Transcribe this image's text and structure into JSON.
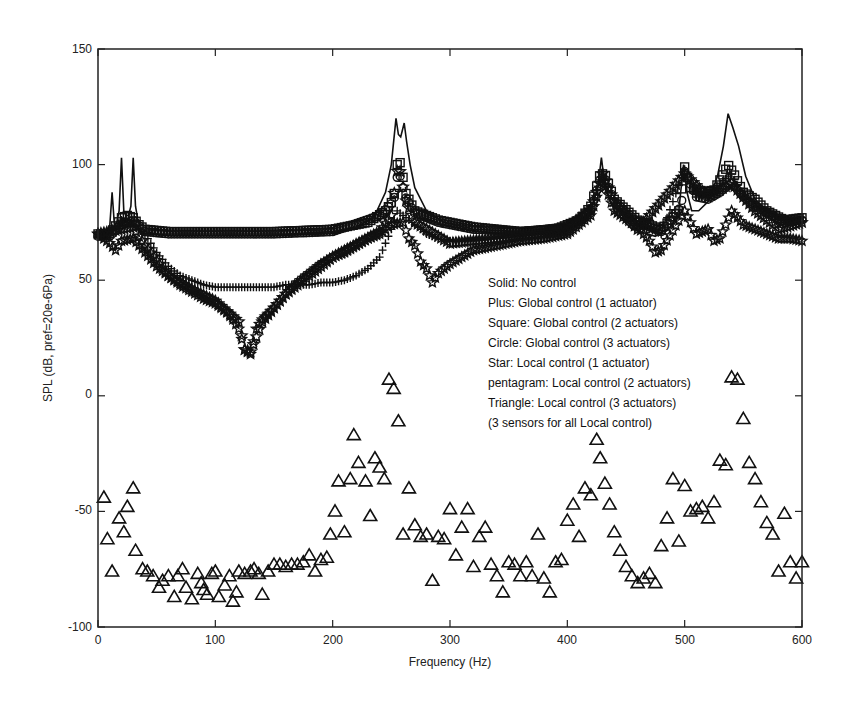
{
  "chart_data": {
    "type": "line",
    "title": "",
    "xlabel": "Frequency (Hz)",
    "ylabel": "SPL (dB, pref=20e-6Pa)",
    "xlim": [
      0,
      600
    ],
    "ylim": [
      -100,
      150
    ],
    "xticks": [
      0,
      100,
      200,
      300,
      400,
      500,
      600
    ],
    "yticks": [
      -100,
      -50,
      0,
      50,
      100,
      150
    ],
    "grid": false,
    "legend_position": "inside-right (text annotation)",
    "legend": [
      "Solid:  No control",
      "Plus:  Global control (1 actuator)",
      "Square:  Global control (2 actuators)",
      "Circle:  Global control (3 actuators)",
      "Star:  Local control (1 actuator)",
      "pentagram:  Local control (2 actuators)",
      "Triangle:  Local control (3 actuators)",
      "(3 sensors for all Local control)"
    ],
    "series": [
      {
        "name": "No control",
        "marker": "solid line",
        "x": [
          0,
          5,
          8,
          10,
          12,
          14,
          16,
          18,
          20,
          22,
          24,
          26,
          28,
          30,
          32,
          34,
          36,
          40,
          50,
          80,
          120,
          160,
          200,
          220,
          235,
          245,
          250,
          254,
          256,
          258,
          261,
          263,
          266,
          270,
          280,
          295,
          320,
          360,
          395,
          410,
          420,
          426,
          429,
          431,
          434,
          440,
          455,
          475,
          488,
          495,
          499,
          502,
          506,
          512,
          520,
          528,
          533,
          537,
          541,
          546,
          552,
          560,
          570,
          580,
          590,
          600
        ],
        "y": [
          70,
          70,
          71,
          73,
          88,
          74,
          75,
          80,
          103,
          80,
          78,
          78,
          82,
          103,
          82,
          76,
          73,
          71,
          70,
          70,
          70,
          70,
          71,
          73,
          77,
          88,
          100,
          120,
          113,
          112,
          118,
          110,
          100,
          90,
          80,
          75,
          72,
          71,
          72,
          75,
          80,
          90,
          103,
          95,
          88,
          80,
          72,
          69,
          73,
          80,
          100,
          88,
          80,
          80,
          84,
          95,
          108,
          122,
          116,
          108,
          95,
          85,
          80,
          76,
          76,
          77
        ]
      },
      {
        "name": "Global control (1 actuator)",
        "marker": "plus",
        "x": [
          0,
          10,
          20,
          30,
          40,
          50,
          60,
          70,
          80,
          90,
          100,
          110,
          120,
          130,
          140,
          150,
          160,
          170,
          180,
          190,
          200,
          210,
          220,
          230,
          240,
          250,
          255,
          260,
          270,
          280,
          290,
          300,
          320,
          340,
          360,
          380,
          400,
          420,
          430,
          440,
          460,
          480,
          500,
          510,
          520,
          530,
          540,
          550,
          560,
          570,
          580,
          590,
          600
        ],
        "y": [
          70,
          70,
          76,
          74,
          70,
          62,
          56,
          52,
          50,
          48,
          47,
          47,
          47,
          47,
          47,
          47,
          48,
          48,
          48,
          49,
          49,
          50,
          52,
          55,
          60,
          72,
          80,
          78,
          74,
          70,
          68,
          67,
          67,
          68,
          69,
          71,
          74,
          82,
          96,
          85,
          74,
          70,
          98,
          86,
          88,
          92,
          96,
          86,
          82,
          80,
          77,
          76,
          77
        ]
      },
      {
        "name": "Global control (2 actuators)",
        "marker": "square",
        "x": [
          0,
          10,
          20,
          25,
          30,
          35,
          40,
          60,
          100,
          150,
          200,
          230,
          245,
          252,
          255,
          258,
          262,
          270,
          290,
          320,
          360,
          390,
          410,
          420,
          428,
          432,
          440,
          460,
          480,
          495,
          500,
          505,
          515,
          525,
          533,
          537,
          542,
          550,
          560,
          570,
          585,
          600
        ],
        "y": [
          70,
          70,
          77,
          78,
          77,
          74,
          72,
          71,
          71,
          71,
          72,
          75,
          80,
          85,
          100,
          101,
          88,
          80,
          76,
          73,
          71,
          72,
          76,
          82,
          96,
          96,
          85,
          76,
          72,
          80,
          99,
          90,
          88,
          89,
          96,
          100,
          96,
          88,
          85,
          80,
          76,
          77
        ]
      },
      {
        "name": "Global control (3 actuators)",
        "marker": "circle",
        "x": [
          0,
          10,
          20,
          30,
          40,
          60,
          100,
          150,
          200,
          240,
          252,
          256,
          262,
          270,
          290,
          320,
          360,
          400,
          420,
          428,
          432,
          440,
          460,
          480,
          497,
          500,
          510,
          520,
          530,
          540,
          550,
          560,
          570,
          585,
          600
        ],
        "y": [
          69,
          69,
          74,
          76,
          71,
          70,
          70,
          70,
          71,
          78,
          84,
          98,
          86,
          79,
          75,
          72,
          71,
          73,
          80,
          94,
          94,
          84,
          75,
          71,
          82,
          97,
          86,
          85,
          88,
          92,
          86,
          82,
          79,
          75,
          76
        ]
      },
      {
        "name": "Local control (1 actuator)",
        "marker": "star",
        "x": [
          0,
          10,
          15,
          20,
          30,
          40,
          50,
          60,
          70,
          80,
          90,
          100,
          110,
          115,
          120,
          125,
          130,
          135,
          140,
          150,
          160,
          170,
          180,
          190,
          200,
          210,
          220,
          230,
          240,
          250,
          260,
          265,
          270,
          275,
          280,
          285,
          290,
          300,
          310,
          320,
          340,
          360,
          380,
          400,
          420,
          430,
          440,
          460,
          470,
          475,
          480,
          500,
          510,
          520,
          525,
          530,
          540,
          550,
          560,
          570,
          580,
          590,
          600
        ],
        "y": [
          70,
          66,
          63,
          67,
          68,
          62,
          56,
          52,
          48,
          45,
          42,
          40,
          36,
          33,
          29,
          20,
          18,
          29,
          33,
          38,
          44,
          49,
          53,
          57,
          60,
          62,
          65,
          68,
          70,
          74,
          75,
          68,
          65,
          58,
          55,
          49,
          53,
          57,
          60,
          63,
          65,
          67,
          68,
          70,
          78,
          94,
          80,
          73,
          67,
          62,
          63,
          80,
          70,
          72,
          67,
          68,
          80,
          74,
          72,
          70,
          68,
          68,
          67
        ]
      },
      {
        "name": "Local control (2 actuators)",
        "marker": "pentagram",
        "x": [
          0,
          20,
          30,
          40,
          60,
          80,
          100,
          120,
          125,
          130,
          140,
          160,
          200,
          240,
          250,
          256,
          262,
          270,
          300,
          340,
          400,
          420,
          430,
          440,
          460,
          500,
          520,
          540,
          560,
          580,
          600
        ],
        "y": [
          70,
          72,
          73,
          65,
          52,
          46,
          41,
          32,
          20,
          19,
          32,
          44,
          60,
          71,
          78,
          101,
          85,
          75,
          66,
          68,
          71,
          80,
          96,
          84,
          72,
          96,
          86,
          92,
          80,
          72,
          75
        ]
      },
      {
        "name": "Local control (3 actuators)",
        "marker": "triangle",
        "x": [
          5,
          8,
          12,
          18,
          22,
          25,
          30,
          32,
          38,
          42,
          47,
          52,
          55,
          60,
          65,
          68,
          72,
          75,
          80,
          85,
          88,
          90,
          93,
          97,
          100,
          103,
          108,
          112,
          115,
          118,
          120,
          125,
          130,
          133,
          137,
          140,
          145,
          150,
          155,
          160,
          165,
          170,
          175,
          180,
          185,
          190,
          195,
          198,
          202,
          205,
          210,
          215,
          218,
          222,
          228,
          232,
          236,
          240,
          244,
          248,
          252,
          256,
          260,
          265,
          270,
          275,
          280,
          285,
          290,
          295,
          300,
          305,
          310,
          315,
          320,
          325,
          330,
          335,
          340,
          345,
          350,
          355,
          360,
          365,
          370,
          375,
          380,
          385,
          390,
          395,
          400,
          405,
          410,
          415,
          420,
          425,
          428,
          432,
          436,
          440,
          445,
          450,
          455,
          460,
          465,
          470,
          475,
          480,
          485,
          490,
          495,
          500,
          505,
          510,
          515,
          520,
          525,
          530,
          535,
          540,
          545,
          550,
          555,
          560,
          565,
          570,
          575,
          580,
          585,
          590,
          595,
          600
        ],
        "y": [
          -44,
          -62,
          -76,
          -53,
          -59,
          -48,
          -40,
          -67,
          -75,
          -76,
          -78,
          -83,
          -80,
          -78,
          -87,
          -78,
          -75,
          -83,
          -88,
          -77,
          -81,
          -84,
          -86,
          -77,
          -76,
          -87,
          -82,
          -78,
          -89,
          -85,
          -76,
          -77,
          -76,
          -75,
          -77,
          -86,
          -76,
          -73,
          -73,
          -74,
          -73,
          -73,
          -72,
          -69,
          -76,
          -71,
          -70,
          -60,
          -50,
          -37,
          -59,
          -36,
          -17,
          -29,
          -37,
          -52,
          -27,
          -31,
          -36,
          7,
          3,
          -11,
          -60,
          -40,
          -56,
          -61,
          -60,
          -80,
          -61,
          -62,
          -49,
          -69,
          -57,
          -49,
          -74,
          -61,
          -57,
          -73,
          -78,
          -85,
          -72,
          -73,
          -78,
          -72,
          -78,
          -60,
          -79,
          -85,
          -72,
          -71,
          -54,
          -47,
          -61,
          -40,
          -43,
          -19,
          -27,
          -38,
          -47,
          -59,
          -67,
          -74,
          -78,
          -81,
          -79,
          -77,
          -81,
          -65,
          -53,
          -36,
          -63,
          -39,
          -50,
          -49,
          -48,
          -53,
          -46,
          -28,
          -30,
          8,
          7,
          -10,
          -29,
          -36,
          -46,
          -55,
          -60,
          -76,
          -51,
          -72,
          -79,
          -72
        ]
      }
    ]
  },
  "axes": {
    "x_tick_labels": [
      "0",
      "100",
      "200",
      "300",
      "400",
      "500",
      "600"
    ],
    "y_tick_labels": [
      "-100",
      "-50",
      "0",
      "50",
      "100",
      "150"
    ],
    "xlabel": "Frequency (Hz)",
    "ylabel": "SPL (dB, pref=20e-6Pa)"
  },
  "legend": {
    "lines": [
      "Solid:  No control",
      "Plus:  Global control (1 actuator)",
      "Square:  Global control (2 actuators)",
      "Circle:  Global control (3 actuators)",
      "Star:  Local control (1 actuator)",
      "pentagram:  Local control (2 actuators)",
      "Triangle:  Local control (3 actuators)",
      "(3 sensors for all Local control)"
    ]
  },
  "colors": {
    "ink": "#111111",
    "background": "#ffffff"
  }
}
